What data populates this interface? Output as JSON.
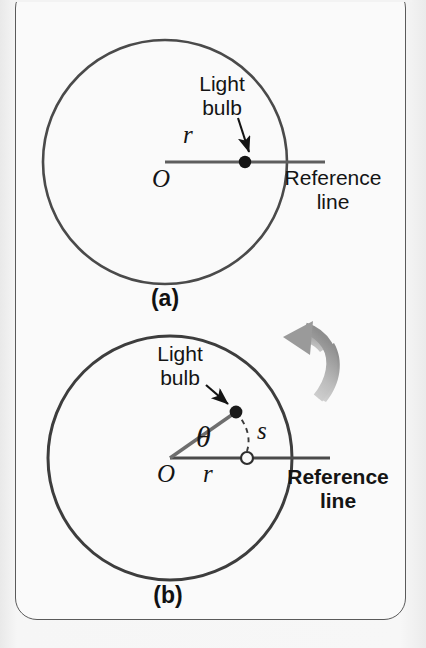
{
  "figure": {
    "background_color": "#f3f3f3",
    "panel_color": "#fafafa",
    "panel_border_color": "#5a5a5a",
    "ink_color": "#141414",
    "line_color": "#555555",
    "arrow_gray": "#a8a8a8",
    "panels": [
      {
        "id": "a",
        "caption": "(a)",
        "circle": {
          "cx": 165,
          "cy": 162,
          "r": 122
        },
        "reference_line": {
          "x1": 165,
          "y1": 162,
          "x2": 325,
          "y2": 162
        },
        "bulb": {
          "cx": 245,
          "cy": 162,
          "type": "filled-dot"
        },
        "labels": {
          "bulb_line1": "Light",
          "bulb_line2": "bulb",
          "radius": "r",
          "origin": "O",
          "reference_line1": "Reference",
          "reference_line2": "line",
          "reference_bold": false
        }
      },
      {
        "id": "b",
        "caption": "(b)",
        "circle": {
          "cx": 170,
          "cy": 458,
          "r": 122
        },
        "reference_line": {
          "x1": 170,
          "y1": 458,
          "x2": 330,
          "y2": 458
        },
        "radius_line": {
          "x1": 170,
          "y1": 458,
          "x2": 236,
          "y2": 412
        },
        "bulb": {
          "cx": 236,
          "cy": 412,
          "type": "filled-dot"
        },
        "marker": {
          "cx": 247,
          "cy": 458,
          "type": "hollow-circle"
        },
        "arc_dashed": {
          "from_x": 236,
          "from_y": 412,
          "to_x": 247,
          "to_y": 458
        },
        "rotation_arrow": "counterclockwise-curved-arrow",
        "labels": {
          "bulb_line1": "Light",
          "bulb_line2": "bulb",
          "radius": "r",
          "origin": "O",
          "angle": "θ",
          "arc_length": "s",
          "reference_line1": "Reference",
          "reference_line2": "line",
          "reference_bold": true
        }
      }
    ]
  }
}
